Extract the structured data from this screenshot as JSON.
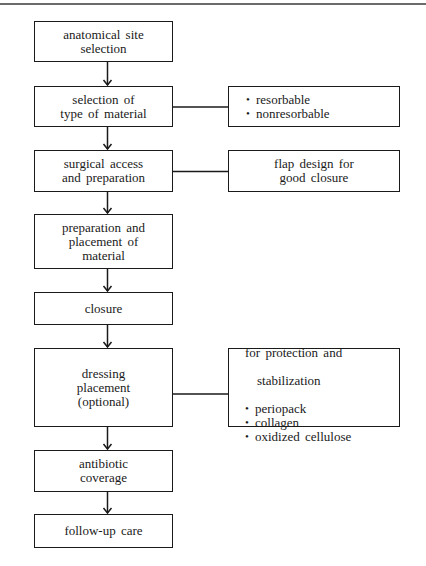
{
  "diagram": {
    "type": "flowchart",
    "steps": [
      {
        "id": "step1",
        "label": "anatomical site\nselection"
      },
      {
        "id": "step2",
        "label": "selection of\ntype of material"
      },
      {
        "id": "step3",
        "label": "surgical access\nand preparation"
      },
      {
        "id": "step4",
        "label": "preparation and\nplacement of\nmaterial"
      },
      {
        "id": "step5",
        "label": "closure"
      },
      {
        "id": "step6",
        "label": "dressing\nplacement\n(optional)"
      },
      {
        "id": "step7",
        "label": "antibiotic\ncoverage"
      },
      {
        "id": "step8",
        "label": "follow-up care"
      }
    ],
    "side_notes": [
      {
        "attached_to": "step2",
        "items": [
          "resorbable",
          "nonresorbable"
        ]
      },
      {
        "attached_to": "step3",
        "text": "flap design for\ngood closure"
      },
      {
        "attached_to": "step6",
        "lead_line1": "for protection and",
        "lead_line2": "stabilization",
        "items": [
          "periopack",
          "collagen",
          "oxidized cellulose"
        ]
      }
    ],
    "edges": [
      [
        "step1",
        "step2"
      ],
      [
        "step2",
        "step3"
      ],
      [
        "step3",
        "step4"
      ],
      [
        "step4",
        "step5"
      ],
      [
        "step5",
        "step6"
      ],
      [
        "step6",
        "step7"
      ],
      [
        "step7",
        "step8"
      ]
    ]
  }
}
